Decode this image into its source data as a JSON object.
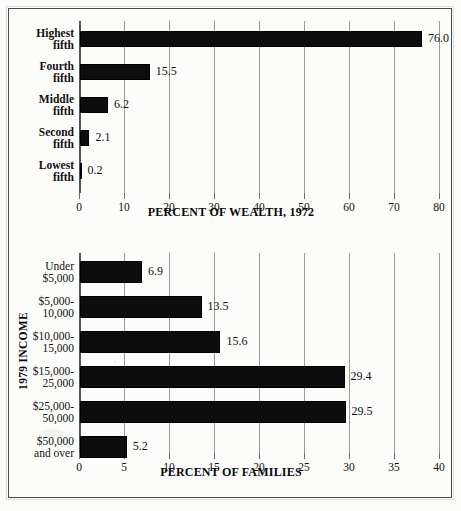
{
  "figure": {
    "background_color": "#fbfbf9",
    "bar_color": "#0d0d0d",
    "grid_color": "#9a9a9a",
    "frame_color": "#4a4a4a"
  },
  "chart_data": [
    {
      "type": "bar",
      "orientation": "horizontal",
      "title": "",
      "xlabel": "PERCENT OF WEALTH, 1972",
      "ylabel": "",
      "categories": [
        "Highest fifth",
        "Fourth fifth",
        "Middle fifth",
        "Second fifth",
        "Lowest fifth"
      ],
      "category_lines": [
        [
          "Highest",
          "fifth"
        ],
        [
          "Fourth",
          "fifth"
        ],
        [
          "Middle",
          "fifth"
        ],
        [
          "Second",
          "fifth"
        ],
        [
          "Lowest",
          "fifth"
        ]
      ],
      "values": [
        76.0,
        15.5,
        6.2,
        2.1,
        0.2
      ],
      "value_labels": [
        "76.0",
        "15.5",
        "6.2",
        "2.1",
        "0.2"
      ],
      "xlim": [
        0,
        80
      ],
      "xticks": [
        0,
        10,
        20,
        30,
        40,
        50,
        60,
        70,
        80
      ],
      "xtick_labels": [
        "0",
        "10",
        "20",
        "30",
        "40",
        "50",
        "60",
        "70",
        "80"
      ],
      "grid": true,
      "legend": "none",
      "label_bold": true
    },
    {
      "type": "bar",
      "orientation": "horizontal",
      "title": "",
      "xlabel": "PERCENT OF FAMILIES",
      "ylabel": "1979 INCOME",
      "categories": [
        "Under $5,000",
        "$5,000-10,000",
        "$10,000-15,000",
        "$15,000-25,000",
        "$25,000-50,000",
        "$50,000 and over"
      ],
      "category_lines": [
        [
          "Under",
          "$5,000"
        ],
        [
          "$5,000-",
          "10,000"
        ],
        [
          "$10,000-",
          "15,000"
        ],
        [
          "$15,000-",
          "25,000"
        ],
        [
          "$25,000-",
          "50,000"
        ],
        [
          "$50,000",
          "and over"
        ]
      ],
      "values": [
        6.9,
        13.5,
        15.6,
        29.4,
        29.5,
        5.2
      ],
      "value_labels": [
        "6.9",
        "13.5",
        "15.6",
        "29.4",
        "29.5",
        "5.2"
      ],
      "xlim": [
        0,
        40
      ],
      "xticks": [
        0,
        5,
        10,
        15,
        20,
        25,
        30,
        35,
        40
      ],
      "xtick_labels": [
        "0",
        "5",
        "10",
        "15",
        "20",
        "25",
        "30",
        "35",
        "40"
      ],
      "grid": true,
      "legend": "none",
      "label_bold": false
    }
  ]
}
